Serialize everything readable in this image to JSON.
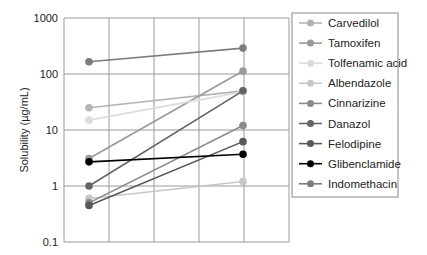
{
  "chart_data": {
    "type": "line",
    "title": "",
    "xlabel": "",
    "ylabel": "Solubility (µg/mL)",
    "yscale": "log",
    "ylim": [
      0.1,
      1000
    ],
    "y_ticks": [
      "1000",
      "100",
      "10",
      "1",
      "0.1"
    ],
    "grid": true,
    "legend_position": "right",
    "x": [
      0,
      1
    ],
    "series": [
      {
        "name": "Carvedilol",
        "color": "#b4b4b4",
        "values": [
          25,
          50
        ]
      },
      {
        "name": "Tamoxifen",
        "color": "#9a9a9a",
        "values": [
          3.1,
          113
        ]
      },
      {
        "name": "Tolfenamic acid",
        "color": "#dcdcdc",
        "values": [
          15,
          48
        ]
      },
      {
        "name": "Albendazole",
        "color": "#c6c6c6",
        "values": [
          0.6,
          1.2
        ]
      },
      {
        "name": "Cinnarizine",
        "color": "#8a8a8a",
        "values": [
          0.5,
          12
        ]
      },
      {
        "name": "Danazol",
        "color": "#646464",
        "values": [
          1.0,
          50
        ]
      },
      {
        "name": "Felodipine",
        "color": "#585858",
        "values": [
          0.45,
          6.2
        ]
      },
      {
        "name": "Glibenclamide",
        "color": "#000000",
        "values": [
          2.7,
          3.7
        ]
      },
      {
        "name": "Indomethacin",
        "color": "#7c7c7c",
        "values": [
          165,
          290
        ]
      }
    ]
  }
}
